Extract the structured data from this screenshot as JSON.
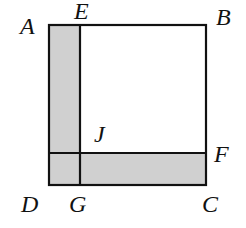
{
  "diagram": {
    "type": "geometry-figure",
    "colors": {
      "stroke": "#111111",
      "shade": "#d0d0d0",
      "background": "#ffffff"
    },
    "points": {
      "A": {
        "label": "A",
        "x": 49,
        "y": 25
      },
      "E": {
        "label": "E",
        "x": 80,
        "y": 25
      },
      "B": {
        "label": "B",
        "x": 206,
        "y": 25
      },
      "J": {
        "label": "J",
        "x": 80,
        "y": 153
      },
      "F": {
        "label": "F",
        "x": 206,
        "y": 153
      },
      "D": {
        "label": "D",
        "x": 49,
        "y": 185
      },
      "G": {
        "label": "G",
        "x": 80,
        "y": 185
      },
      "C": {
        "label": "C",
        "x": 206,
        "y": 185
      }
    },
    "labels": {
      "A": "A",
      "E": "E",
      "B": "B",
      "J": "J",
      "F": "F",
      "D": "D",
      "G": "G",
      "C": "C"
    },
    "shaded_regions": [
      "AEGD",
      "JFCG (bottom strip from D to C)"
    ]
  }
}
